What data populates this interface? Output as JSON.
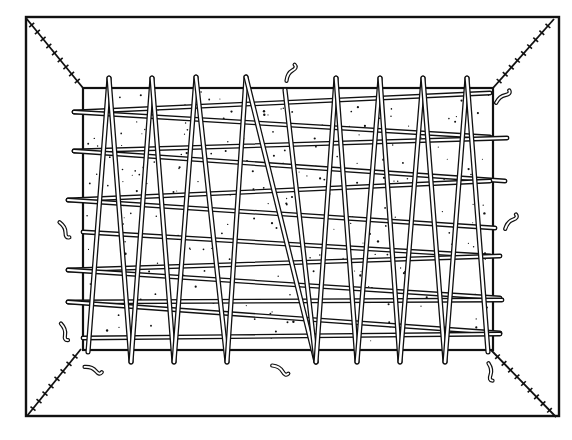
{
  "figure": {
    "title": "",
    "colors": {
      "ink": "#111111",
      "paper": "#ffffff",
      "rod_fill": "#ffffff"
    }
  },
  "outer_frame": {
    "x": 26,
    "y": 17,
    "w": 533,
    "h": 399
  },
  "inner_panel": {
    "x": 83,
    "y": 88,
    "w": 410,
    "h": 262
  },
  "corner_seams": [
    {
      "name": "top-left",
      "x1": 26,
      "y1": 18,
      "x2": 83,
      "y2": 88
    },
    {
      "name": "top-right",
      "x1": 554,
      "y1": 19,
      "x2": 493,
      "y2": 88
    },
    {
      "name": "bottom-left",
      "x1": 27,
      "y1": 416,
      "x2": 81,
      "y2": 349
    },
    {
      "name": "bottom-right",
      "x1": 556,
      "y1": 417,
      "x2": 491,
      "y2": 350
    }
  ],
  "horizontal_rods": [
    {
      "x1": 74,
      "y1": 112,
      "x2": 490,
      "y2": 93
    },
    {
      "x1": 74,
      "y1": 112,
      "x2": 490,
      "y2": 137
    },
    {
      "x1": 74,
      "y1": 151,
      "x2": 507,
      "y2": 138
    },
    {
      "x1": 74,
      "y1": 151,
      "x2": 505,
      "y2": 181
    },
    {
      "x1": 68,
      "y1": 200,
      "x2": 490,
      "y2": 181
    },
    {
      "x1": 68,
      "y1": 200,
      "x2": 495,
      "y2": 228
    },
    {
      "x1": 83,
      "y1": 232,
      "x2": 490,
      "y2": 256
    },
    {
      "x1": 68,
      "y1": 270,
      "x2": 500,
      "y2": 256
    },
    {
      "x1": 68,
      "y1": 270,
      "x2": 500,
      "y2": 298
    },
    {
      "x1": 68,
      "y1": 302,
      "x2": 502,
      "y2": 300
    },
    {
      "x1": 68,
      "y1": 302,
      "x2": 500,
      "y2": 333
    },
    {
      "x1": 83,
      "y1": 338,
      "x2": 500,
      "y2": 334
    }
  ],
  "poles": [
    {
      "x1": 109,
      "y1": 78,
      "x2": 88,
      "y2": 352
    },
    {
      "x1": 109,
      "y1": 78,
      "x2": 131,
      "y2": 362
    },
    {
      "x1": 152,
      "y1": 78,
      "x2": 131,
      "y2": 362
    },
    {
      "x1": 152,
      "y1": 78,
      "x2": 174,
      "y2": 362
    },
    {
      "x1": 196,
      "y1": 77,
      "x2": 174,
      "y2": 362
    },
    {
      "x1": 196,
      "y1": 77,
      "x2": 227,
      "y2": 362
    },
    {
      "x1": 246,
      "y1": 77,
      "x2": 227,
      "y2": 362
    },
    {
      "x1": 246,
      "y1": 77,
      "x2": 316,
      "y2": 362
    },
    {
      "x1": 285,
      "y1": 90,
      "x2": 316,
      "y2": 362
    },
    {
      "x1": 336,
      "y1": 78,
      "x2": 316,
      "y2": 362
    },
    {
      "x1": 336,
      "y1": 78,
      "x2": 357,
      "y2": 362
    },
    {
      "x1": 380,
      "y1": 78,
      "x2": 357,
      "y2": 362
    },
    {
      "x1": 380,
      "y1": 78,
      "x2": 400,
      "y2": 362
    },
    {
      "x1": 423,
      "y1": 78,
      "x2": 400,
      "y2": 362
    },
    {
      "x1": 423,
      "y1": 78,
      "x2": 445,
      "y2": 362
    },
    {
      "x1": 467,
      "y1": 78,
      "x2": 445,
      "y2": 362
    },
    {
      "x1": 467,
      "y1": 78,
      "x2": 488,
      "y2": 352
    }
  ],
  "twigs": [
    {
      "name": "twig-top-center",
      "x": 291,
      "y": 73,
      "rot": -60
    },
    {
      "name": "twig-top-right",
      "x": 503,
      "y": 97,
      "rot": -40
    },
    {
      "name": "twig-left-upper",
      "x": 64,
      "y": 230,
      "rot": 60
    },
    {
      "name": "twig-right-middle",
      "x": 511,
      "y": 222,
      "rot": -50
    },
    {
      "name": "twig-left-lower",
      "x": 64,
      "y": 332,
      "rot": 70
    },
    {
      "name": "twig-bottom-left",
      "x": 93,
      "y": 370,
      "rot": 20
    },
    {
      "name": "twig-bottom-center",
      "x": 280,
      "y": 370,
      "rot": 30
    },
    {
      "name": "twig-bottom-right",
      "x": 490,
      "y": 372,
      "rot": 80
    }
  ]
}
